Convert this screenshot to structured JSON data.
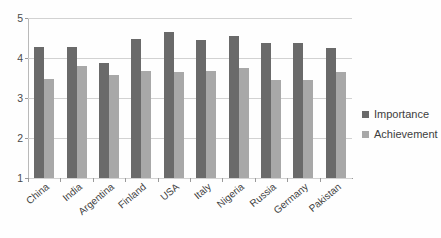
{
  "chart_data": {
    "type": "bar",
    "title": "",
    "subtitle": "",
    "xlabel": "",
    "ylabel": "",
    "ylim": [
      1,
      5
    ],
    "yticks": [
      1,
      2,
      3,
      4,
      5
    ],
    "ytick_labels": [
      "1",
      "2",
      "3",
      "4",
      "5"
    ],
    "grid": true,
    "legend_position": "right",
    "categories": [
      "China",
      "India",
      "Argentina",
      "Finland",
      "USA",
      "Italy",
      "Nigeria",
      "Russia",
      "Germany",
      "Pakistan"
    ],
    "series": [
      {
        "name": "Importance",
        "color": "#6a6a6a",
        "values": [
          4.28,
          4.28,
          3.88,
          4.47,
          4.65,
          4.45,
          4.55,
          4.38,
          4.38,
          4.26
        ]
      },
      {
        "name": "Achievement",
        "color": "#a8a8a8",
        "values": [
          3.48,
          3.8,
          3.58,
          3.68,
          3.65,
          3.67,
          3.75,
          3.46,
          3.45,
          3.65
        ]
      }
    ]
  },
  "legend": {
    "items": [
      {
        "label": "Importance",
        "color": "#6a6a6a"
      },
      {
        "label": "Achievement",
        "color": "#a8a8a8"
      }
    ]
  },
  "colors": {
    "importance": "#6a6a6a",
    "achievement": "#a8a8a8",
    "gridline": "#d2d2d2",
    "axis": "#9a9a9a",
    "background": "#ffffff",
    "text": "#3d3d3d"
  }
}
